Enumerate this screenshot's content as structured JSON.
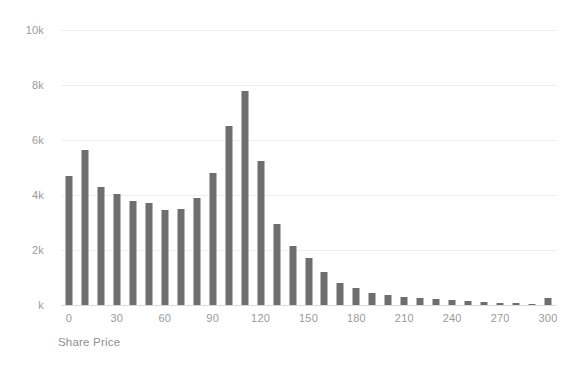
{
  "chart_data": {
    "type": "bar",
    "title": "",
    "subtitle": "",
    "xlabel": "Share Price",
    "ylabel": "",
    "grid": true,
    "legend": null,
    "legend_position": "none",
    "bar_color": "#6e6e6e",
    "gridline_color": "#ededed",
    "axis_text_color": "#9a9a9a",
    "background_color": "#ffffff",
    "xlim": [
      -5,
      305
    ],
    "ylim": [
      0,
      10000
    ],
    "bin_width": 10,
    "x_tick_labels": [
      "0",
      "30",
      "60",
      "90",
      "120",
      "150",
      "180",
      "210",
      "240",
      "270",
      "300"
    ],
    "x_tick_values": [
      0,
      30,
      60,
      90,
      120,
      150,
      180,
      210,
      240,
      270,
      300
    ],
    "y_tick_labels": [
      "k",
      "2k",
      "4k",
      "6k",
      "8k",
      "10k"
    ],
    "y_tick_values": [
      0,
      2000,
      4000,
      6000,
      8000,
      10000
    ],
    "categories": [
      0,
      10,
      20,
      30,
      40,
      50,
      60,
      70,
      80,
      90,
      100,
      110,
      120,
      130,
      140,
      150,
      160,
      170,
      180,
      190,
      200,
      210,
      220,
      230,
      240,
      250,
      260,
      270,
      280,
      290,
      300
    ],
    "values": [
      4700,
      5650,
      4300,
      4050,
      3800,
      3700,
      3450,
      3500,
      3900,
      4800,
      6500,
      7800,
      5250,
      2950,
      2150,
      1700,
      1200,
      800,
      620,
      430,
      380,
      300,
      250,
      220,
      200,
      150,
      120,
      90,
      70,
      50,
      250
    ]
  },
  "axis": {
    "x_title": "Share Price"
  }
}
